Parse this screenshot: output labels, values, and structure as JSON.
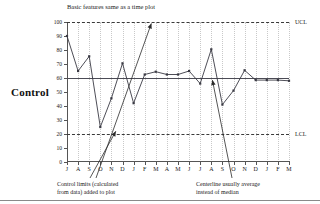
{
  "side_label": "Control",
  "chart_data": {
    "type": "line",
    "title": "Basic features same as a time plot",
    "xlabel": "",
    "ylabel": "",
    "ylim": [
      0,
      100
    ],
    "ytick_values": [
      0,
      10,
      20,
      30,
      40,
      50,
      60,
      70,
      80,
      90,
      100
    ],
    "ytick_labels": [
      "0",
      "10",
      "20",
      "30",
      "40",
      "50",
      "60",
      "70",
      "80",
      "90",
      "100"
    ],
    "grid": true,
    "legend": "none",
    "categories": [
      "J",
      "A",
      "S",
      "O",
      "N",
      "D",
      "J",
      "F",
      "M",
      "A",
      "M",
      "J",
      "J",
      "A",
      "S",
      "O",
      "N",
      "D",
      "J",
      "F",
      "M"
    ],
    "values": [
      90,
      65,
      75.5,
      25,
      45.5,
      70.5,
      42,
      62.5,
      64.5,
      62.5,
      62.5,
      65,
      56,
      80.5,
      41,
      51,
      65.5,
      58.5,
      58.5,
      58.5,
      58
    ],
    "reference_lines": [
      {
        "name": "UCL",
        "label": "UCL",
        "value": 100,
        "style": "dashed"
      },
      {
        "name": "centerline",
        "label": "",
        "value": 60,
        "style": "solid"
      },
      {
        "name": "LCL",
        "label": "LCL",
        "value": 20,
        "style": "dashed"
      }
    ],
    "annotations": [
      {
        "name": "control-limits-note",
        "lines": [
          "Control limits (calculated",
          "from data) added to plot"
        ],
        "points_to": [
          "UCL",
          "LCL"
        ]
      },
      {
        "name": "centerline-note",
        "lines": [
          "Centerline usually average",
          "instead of median"
        ],
        "points_to": [
          "centerline"
        ]
      }
    ]
  },
  "colors": {
    "series": "#3a3a44",
    "centerline": "#4b4b55",
    "limits": "#3a3a3a",
    "grid": "#c9c9c9",
    "axis": "#555555",
    "text": "#1a1a1a"
  }
}
